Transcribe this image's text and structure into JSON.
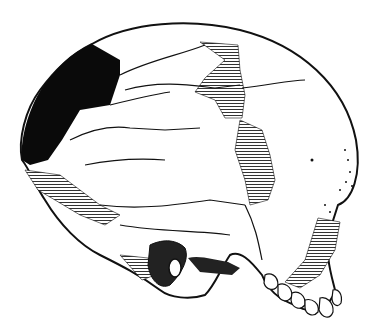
{
  "figure": {
    "style": "black ink line drawing with hatched reconstruction areas",
    "colors": {
      "background": "#ffffff",
      "ink": "#111111",
      "hatch": "#333333",
      "missing_region_fill": "#0a0a0a"
    }
  }
}
